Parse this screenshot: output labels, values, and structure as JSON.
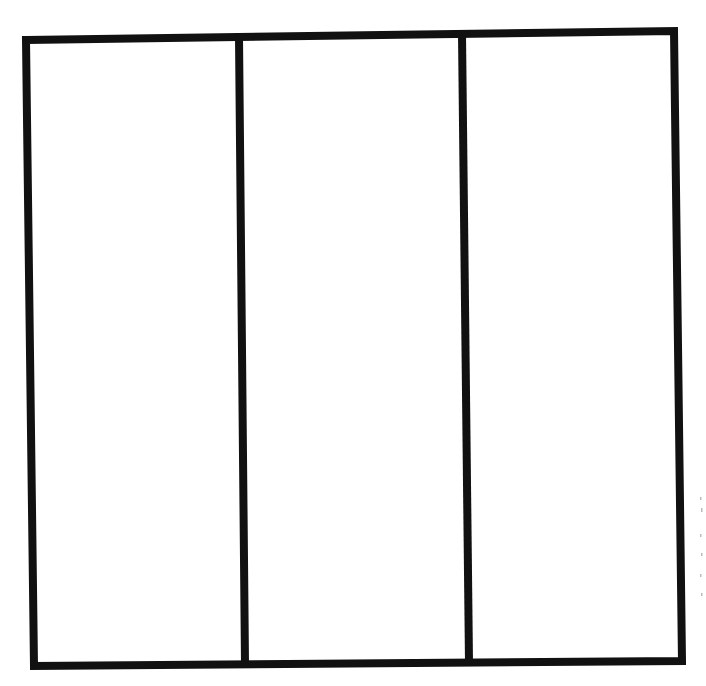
{
  "diagram": {
    "type": "three-column-grid",
    "columns": 3,
    "rows": 1,
    "cells": [
      {
        "label": ""
      },
      {
        "label": ""
      },
      {
        "label": ""
      }
    ],
    "line_color": "#111111",
    "background_color": "#ffffff"
  }
}
